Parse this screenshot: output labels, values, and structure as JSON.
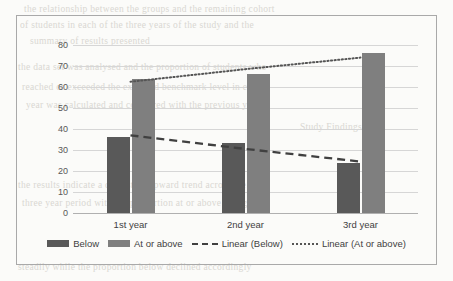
{
  "chart_data": {
    "type": "bar",
    "title": "",
    "xlabel": "",
    "ylabel": "",
    "categories": [
      "1st year",
      "2nd year",
      "3rd year"
    ],
    "ylim": [
      0,
      80
    ],
    "yticks": [
      80,
      70,
      60,
      50,
      40,
      30,
      20,
      10,
      0
    ],
    "grid": true,
    "legend_position": "bottom",
    "series": [
      {
        "name": "Below",
        "type": "bar",
        "color": "#595959",
        "values": [
          36,
          33.5,
          24
        ]
      },
      {
        "name": "At or above",
        "type": "bar",
        "color": "#7f7f7f",
        "values": [
          64,
          66,
          76
        ]
      },
      {
        "name": "Linear (Below)",
        "type": "line",
        "style": "dashed",
        "color": "#404040",
        "values": [
          37,
          30.5,
          24.5
        ]
      },
      {
        "name": "Linear (At or above)",
        "type": "line",
        "style": "dotted",
        "color": "#555555",
        "values": [
          62.5,
          68.5,
          74
        ]
      }
    ]
  },
  "legend": {
    "items": [
      {
        "label": "Below",
        "key": "swatch-below"
      },
      {
        "label": "At or above",
        "key": "swatch-above"
      },
      {
        "label": "Linear (Below)",
        "key": "line-dashed"
      },
      {
        "label": "Linear (At or above)",
        "key": "line-dotted"
      }
    ]
  },
  "background_text": {
    "lines": [
      "the relationship between the groups and the remaining cohort",
      "of students in each of the three years of the study and the",
      "summary of results presented",
      "the data set was analysed and the proportion of students who",
      "reached or exceeded the expected benchmark level in each",
      "year was calculated and compared with the previous year",
      "Study Findings",
      "the results indicate a consistent upward trend across the",
      "three year period with the proportion at or above rising",
      "steadily while the proportion below declined accordingly"
    ]
  }
}
